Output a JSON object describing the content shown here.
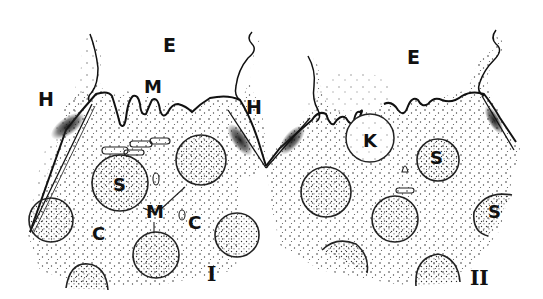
{
  "figure": {
    "panels": [
      {
        "id": "I",
        "label": "I"
      },
      {
        "id": "II",
        "label": "II"
      }
    ],
    "labels": {
      "e_left": "E",
      "e_right": "E",
      "m_top": "M",
      "h_left": "H",
      "h_mid": "H",
      "s_left": "S",
      "m_center": "M",
      "c_left": "C",
      "c_right": "C",
      "panel_one": "I",
      "k": "K",
      "s_right_top": "S",
      "s_right_edge": "S",
      "panel_two": "II"
    },
    "legend_meaning": {
      "E": "exterior",
      "H": "hemidesmosome / junction",
      "M": "membrane / microvilli",
      "S": "secretory granule",
      "C": "cytoplasm",
      "K": "vacuole"
    },
    "colors": {
      "ink": "#111111",
      "stipple": "#333333",
      "background": "#ffffff"
    }
  }
}
